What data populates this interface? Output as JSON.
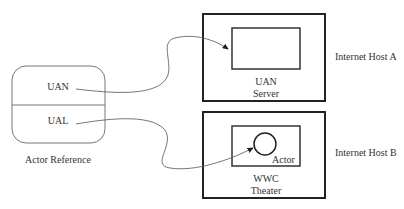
{
  "diagram": {
    "actor_reference": {
      "caption": "Actor Reference",
      "fields": [
        "UAN",
        "UAL"
      ]
    },
    "host_a": {
      "label": "Internet Host A",
      "inner_label_line1": "UAN",
      "inner_label_line2": "Server"
    },
    "host_b": {
      "label": "Internet Host B",
      "actor_label": "Actor",
      "inner_label_line1": "WWC",
      "inner_label_line2": "Theater"
    },
    "arrows": [
      {
        "from": "UAN",
        "to": "UAN Server"
      },
      {
        "from": "UAL",
        "to": "Actor"
      }
    ],
    "colors": {
      "stroke": "#222222",
      "thin_stroke": "#555555",
      "text": "#333333"
    }
  }
}
